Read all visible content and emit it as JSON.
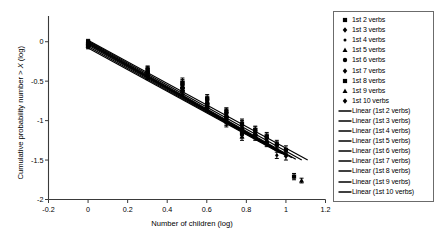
{
  "chart_data": {
    "type": "scatter",
    "title": "",
    "xlabel": "Number of children (log)",
    "ylabel": "Cumulative probability number > X (log)",
    "xlim": [
      -0.2,
      1.2
    ],
    "ylim": [
      -2,
      0.25
    ],
    "xticks": [
      "-0.2",
      "0",
      "0.2",
      "0.4",
      "0.6",
      "0.8",
      "1",
      "1.2"
    ],
    "xtick_values": [
      -0.2,
      0,
      0.2,
      0.4,
      0.6,
      0.8,
      1.0,
      1.2
    ],
    "yticks": [
      "0",
      "-0.5",
      "-1",
      "-1.5",
      "-2"
    ],
    "ytick_values": [
      0,
      -0.5,
      -1,
      -1.5,
      -2
    ],
    "grid": false,
    "legend_position": "right",
    "marker_color": "#000000",
    "line_color": "#000000",
    "series": [
      {
        "name": "1st 2 verbs",
        "marker": "square",
        "x": [
          0,
          0.301,
          0.477,
          0.602,
          0.699,
          0.778,
          0.845,
          0.903,
          0.954,
          1.0,
          1.041
        ],
        "y": [
          0.0,
          -0.36,
          -0.52,
          -0.72,
          -0.89,
          -1.04,
          -1.12,
          -1.2,
          -1.3,
          -1.37,
          -1.71
        ],
        "yerr": [
          0.03,
          0.05,
          0.06,
          0.05,
          0.05,
          0.06,
          0.05,
          0.05,
          0.05,
          0.05,
          0.04
        ]
      },
      {
        "name": "1st 3 verbs",
        "marker": "diamond",
        "x": [
          0,
          0.301,
          0.477,
          0.602,
          0.699,
          0.778,
          0.845,
          0.903,
          0.954,
          1.0
        ],
        "y": [
          -0.01,
          -0.37,
          -0.55,
          -0.74,
          -0.9,
          -1.06,
          -1.13,
          -1.22,
          -1.32,
          -1.45
        ],
        "yerr": [
          0.03,
          0.06,
          0.07,
          0.05,
          0.06,
          0.06,
          0.05,
          0.05,
          0.05,
          0.05
        ]
      },
      {
        "name": "1st 4 verbs",
        "marker": "dot",
        "x": [
          0,
          0.301,
          0.477,
          0.602,
          0.699,
          0.778,
          0.845,
          0.903,
          0.954
        ],
        "y": [
          -0.02,
          -0.38,
          -0.56,
          -0.76,
          -0.92,
          -1.08,
          -1.15,
          -1.24,
          -1.44
        ],
        "yerr": [
          0.03,
          0.05,
          0.06,
          0.05,
          0.06,
          0.06,
          0.05,
          0.05,
          0.04
        ]
      },
      {
        "name": "1st 5 verbs",
        "marker": "triangle",
        "x": [
          0,
          0.301,
          0.477,
          0.602,
          0.699,
          0.778,
          0.845,
          0.903,
          1.079
        ],
        "y": [
          -0.02,
          -0.38,
          -0.57,
          -0.77,
          -0.93,
          -1.09,
          -1.16,
          -1.26,
          -1.76
        ],
        "yerr": [
          0.03,
          0.05,
          0.06,
          0.05,
          0.06,
          0.06,
          0.05,
          0.05,
          0.03
        ]
      },
      {
        "name": "1st 6 verbs",
        "marker": "circle",
        "x": [
          0,
          0.301,
          0.477,
          0.602,
          0.699,
          0.778,
          0.845,
          0.903
        ],
        "y": [
          -0.03,
          -0.39,
          -0.58,
          -0.78,
          -0.95,
          -1.11,
          -1.18,
          -1.28
        ],
        "yerr": [
          0.03,
          0.05,
          0.06,
          0.05,
          0.06,
          0.06,
          0.05,
          0.05
        ]
      },
      {
        "name": "1st 7 verbs",
        "marker": "diamond",
        "x": [
          0,
          0.301,
          0.477,
          0.602,
          0.699,
          0.778,
          0.845
        ],
        "y": [
          -0.03,
          -0.4,
          -0.59,
          -0.79,
          -0.96,
          -1.13,
          -1.2
        ],
        "yerr": [
          0.03,
          0.05,
          0.06,
          0.05,
          0.06,
          0.06,
          0.05
        ]
      },
      {
        "name": "1st 8 verbs",
        "marker": "square",
        "x": [
          0,
          0.301,
          0.477,
          0.602,
          0.699,
          0.778
        ],
        "y": [
          -0.04,
          -0.41,
          -0.6,
          -0.81,
          -0.98,
          -1.16
        ],
        "yerr": [
          0.03,
          0.05,
          0.06,
          0.05,
          0.06,
          0.06
        ]
      },
      {
        "name": "1st 9 verbs",
        "marker": "triangle",
        "x": [
          0,
          0.301,
          0.477,
          0.602,
          0.699,
          0.778
        ],
        "y": [
          -0.05,
          -0.42,
          -0.61,
          -0.82,
          -1.0,
          -1.2
        ],
        "yerr": [
          0.03,
          0.05,
          0.06,
          0.05,
          0.06,
          0.05
        ]
      },
      {
        "name": "1st 10 verbs",
        "marker": "diamond",
        "x": [
          0,
          0.301,
          0.477,
          0.602,
          0.699
        ],
        "y": [
          -0.06,
          -0.43,
          -0.62,
          -0.83,
          -1.02
        ],
        "yerr": [
          0.03,
          0.05,
          0.06,
          0.05,
          0.06
        ]
      }
    ],
    "fits": [
      {
        "name": "Linear (1st 2 verbs)",
        "x0": 0.0,
        "y0": 0.02,
        "x1": 1.11,
        "y1": -1.5
      },
      {
        "name": "Linear (1st 3 verbs)",
        "x0": 0.0,
        "y0": 0.01,
        "x1": 1.08,
        "y1": -1.5
      },
      {
        "name": "Linear (1st 4 verbs)",
        "x0": 0.0,
        "y0": 0.0,
        "x1": 1.05,
        "y1": -1.49
      },
      {
        "name": "Linear (1st 5 verbs)",
        "x0": 0.0,
        "y0": -0.01,
        "x1": 1.03,
        "y1": -1.47
      },
      {
        "name": "Linear (1st 6 verbs)",
        "x0": 0.0,
        "y0": -0.02,
        "x1": 1.01,
        "y1": -1.45
      },
      {
        "name": "Linear (1st 7 verbs)",
        "x0": 0.0,
        "y0": -0.03,
        "x1": 1.0,
        "y1": -1.44
      },
      {
        "name": "Linear (1st 8 verbs)",
        "x0": 0.0,
        "y0": -0.04,
        "x1": 0.99,
        "y1": -1.43
      },
      {
        "name": "Linear (1st 9 verbs)",
        "x0": 0.0,
        "y0": -0.06,
        "x1": 0.98,
        "y1": -1.42
      },
      {
        "name": "Linear (1st 10 verbs)",
        "x0": 0.0,
        "y0": -0.08,
        "x1": 0.97,
        "y1": -1.41
      }
    ]
  },
  "legend": {
    "markers": [
      {
        "label": "1st 2 verbs",
        "marker": "square"
      },
      {
        "label": "1st 3 verbs",
        "marker": "diamond"
      },
      {
        "label": "1st 4 verbs",
        "marker": "dot"
      },
      {
        "label": "1st 5 verbs",
        "marker": "triangle"
      },
      {
        "label": "1st 6 verbs",
        "marker": "circle"
      },
      {
        "label": "1st 7 verbs",
        "marker": "diamond"
      },
      {
        "label": "1st 8 verbs",
        "marker": "square"
      },
      {
        "label": "1st 9 verbs",
        "marker": "triangle"
      },
      {
        "label": "1st 10 verbs",
        "marker": "diamond"
      }
    ],
    "lines": [
      {
        "label": "Linear (1st 2 verbs)"
      },
      {
        "label": "Linear (1st 3 verbs)"
      },
      {
        "label": "Linear (1st 4 verbs)"
      },
      {
        "label": "Linear (1st 5 verbs)"
      },
      {
        "label": "Linear (1st 6 verbs)"
      },
      {
        "label": "Linear (1st 7 verbs)"
      },
      {
        "label": "Linear (1st 8 verbs)"
      },
      {
        "label": "Linear (1st 9 verbs)"
      },
      {
        "label": "Linear (1st 10 verbs)"
      }
    ]
  },
  "axes": {
    "x_title": "Number of children (log)",
    "y_title_pre": "Cumulative probability number > ",
    "y_title_var": "X",
    "y_title_post": " (log)"
  }
}
